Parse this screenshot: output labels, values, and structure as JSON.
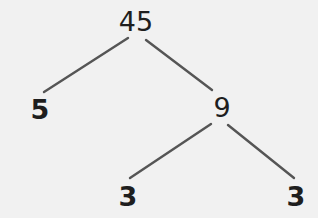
{
  "diagram": {
    "type": "factor-tree",
    "colors": {
      "background": "#f1f1f1",
      "text": "#1e1e1e",
      "edge": "#555555"
    },
    "nodes": {
      "root": {
        "label": "45",
        "x": 136,
        "y": 8,
        "bold": false
      },
      "left": {
        "label": "5",
        "x": 40,
        "y": 96,
        "bold": true
      },
      "right": {
        "label": "9",
        "x": 222,
        "y": 94,
        "bold": false
      },
      "leaf1": {
        "label": "3",
        "x": 128,
        "y": 183,
        "bold": true
      },
      "leaf2": {
        "label": "3",
        "x": 296,
        "y": 183,
        "bold": true
      }
    },
    "edges": [
      {
        "from": "45",
        "to": "5",
        "x1": 128,
        "y1": 38,
        "x2": 44,
        "y2": 92
      },
      {
        "from": "45",
        "to": "9",
        "x1": 146,
        "y1": 40,
        "x2": 212,
        "y2": 90
      },
      {
        "from": "9",
        "to": "3",
        "x1": 211,
        "y1": 124,
        "x2": 130,
        "y2": 178
      },
      {
        "from": "9",
        "to": "3",
        "x1": 228,
        "y1": 125,
        "x2": 294,
        "y2": 178
      }
    ]
  }
}
